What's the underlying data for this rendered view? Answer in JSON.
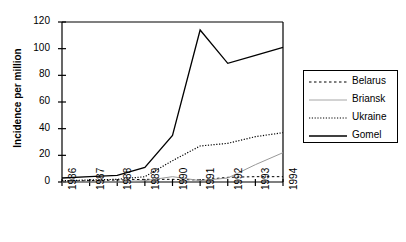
{
  "chart_data": {
    "type": "line",
    "title": "",
    "xlabel": "",
    "ylabel": "Incidence per million",
    "x": [
      "1986",
      "1987",
      "1988",
      "1989",
      "1990",
      "1991",
      "1992",
      "1993",
      "1994"
    ],
    "xlim": [
      1986,
      1994
    ],
    "ylim": [
      0,
      120
    ],
    "yticks": [
      0,
      20,
      40,
      60,
      80,
      100,
      120
    ],
    "xticks": [
      "1986",
      "1987",
      "1988",
      "1989",
      "1990",
      "1991",
      "1992",
      "1993",
      "1994"
    ],
    "grid": false,
    "legend_position": "right-outside",
    "series": [
      {
        "name": "Belarus",
        "style": "dashed",
        "color": "#000000",
        "values": [
          0.5,
          1.0,
          1.5,
          2.0,
          2.0,
          1.5,
          3.5,
          4.0,
          4.0
        ]
      },
      {
        "name": "Briansk",
        "style": "solid-light",
        "color": "#999999",
        "values": [
          0.0,
          0.0,
          0.0,
          1.0,
          4.0,
          1.0,
          3.0,
          13.0,
          22.0
        ]
      },
      {
        "name": "Ukraine",
        "style": "dotted",
        "color": "#000000",
        "values": [
          1.0,
          1.5,
          2.0,
          4.0,
          16.0,
          27.0,
          29.0,
          34.0,
          37.0
        ]
      },
      {
        "name": "Gomel",
        "style": "solid",
        "color": "#000000",
        "values": [
          3.0,
          4.0,
          5.0,
          11.0,
          35.0,
          114.0,
          89.0,
          95.0,
          101.0
        ]
      }
    ]
  },
  "axes": {
    "y_tick_labels": [
      "0",
      "20",
      "40",
      "60",
      "80",
      "100",
      "120"
    ],
    "x_tick_labels": [
      "1986",
      "1987",
      "1988",
      "1989",
      "1990",
      "1991",
      "1992",
      "1993",
      "1994"
    ],
    "y_axis_title": "Incidence per million"
  },
  "legend": {
    "entries": [
      {
        "label": "Belarus"
      },
      {
        "label": "Briansk"
      },
      {
        "label": "Ukraine"
      },
      {
        "label": "Gomel"
      }
    ]
  }
}
